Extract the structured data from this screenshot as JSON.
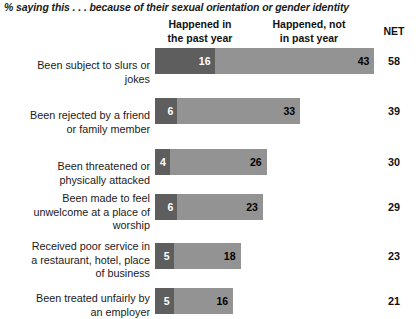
{
  "subtitle": "% saying this . . . because of their sexual orientation or gender identity",
  "headers": {
    "past_year": "Happened in\nthe past year",
    "past_year_line1": "Happened in",
    "past_year_line2": "the past year",
    "not_past_year_line1": "Happened, not",
    "not_past_year_line2": "in past year",
    "net": "NET"
  },
  "chart_data": {
    "type": "bar",
    "title": "% saying this . . . because of their sexual orientation or gender identity",
    "orientation": "horizontal",
    "stacked": true,
    "xlabel": "",
    "ylabel": "",
    "grid": false,
    "legend_position": "top",
    "categories": [
      "Been subject to slurs or jokes",
      "Been rejected by a friend or family member",
      "Been threatened or physically attacked",
      "Been made to feel unwelcome at a place of worship",
      "Received poor service in a restaurant, hotel, place of business",
      "Been treated unfairly by an employer"
    ],
    "series": [
      {
        "name": "Happened in the past year",
        "values": [
          16,
          6,
          4,
          6,
          5,
          5
        ],
        "color": "#5e5e5e"
      },
      {
        "name": "Happened, not in past year",
        "values": [
          43,
          33,
          26,
          23,
          18,
          16
        ],
        "color": "#939393"
      }
    ],
    "net": [
      58,
      39,
      30,
      29,
      23,
      21
    ]
  },
  "rows": [
    {
      "label_lines": [
        "Been subject to slurs or",
        "jokes"
      ],
      "past": 16,
      "not_past": 43,
      "net": 58
    },
    {
      "label_lines": [
        "Been rejected by a friend",
        "or family member"
      ],
      "past": 6,
      "not_past": 33,
      "net": 39
    },
    {
      "label_lines": [
        "Been threatened or",
        "physically attacked"
      ],
      "past": 4,
      "not_past": 26,
      "net": 30
    },
    {
      "label_lines": [
        "Been made to feel",
        "unwelcome at a place of",
        "worship"
      ],
      "past": 6,
      "not_past": 23,
      "net": 29
    },
    {
      "label_lines": [
        "Received poor service in",
        "a restaurant, hotel, place",
        "of business"
      ],
      "past": 5,
      "not_past": 18,
      "net": 23
    },
    {
      "label_lines": [
        "Been treated unfairly by",
        "an employer"
      ],
      "past": 5,
      "not_past": 16,
      "net": 21
    }
  ],
  "layout": {
    "bar_left_px": 155,
    "px_per_unit": 3.72,
    "row_tops": [
      48,
      98,
      149,
      194,
      243,
      288
    ],
    "label_tops": [
      59,
      109,
      160,
      192,
      240,
      292
    ],
    "bar_height": 26
  },
  "colors": {
    "past_year": "#5e5e5e",
    "not_past_year": "#939393",
    "text": "#1a1a1a",
    "background": "#ffffff"
  }
}
